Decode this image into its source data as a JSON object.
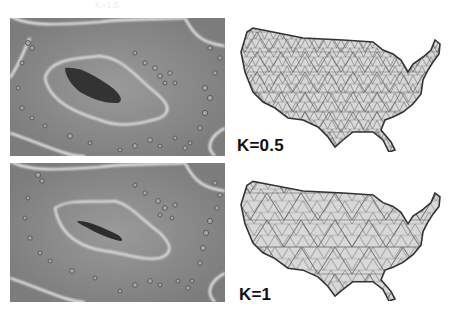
{
  "figure": {
    "ghost_text": "K=1.5",
    "panels": [
      {
        "id": "distance-field-k05",
        "kind": "distance-field",
        "row": 1
      },
      {
        "id": "mesh-k05",
        "kind": "triangle-mesh",
        "row": 1,
        "label": "K=0.5"
      },
      {
        "id": "distance-field-k1",
        "kind": "distance-field",
        "row": 2
      },
      {
        "id": "mesh-k1",
        "kind": "triangle-mesh",
        "row": 2,
        "label": "K=1"
      }
    ],
    "colors": {
      "field_background": "#8d8d8d",
      "field_contour": "#f2f2f2",
      "field_core": "#3a3a3a",
      "mesh_fill": "#d6d6d6",
      "mesh_edge": "#555555",
      "label": "#111111"
    }
  }
}
